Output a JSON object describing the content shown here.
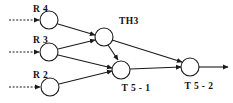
{
  "diagram": {
    "type": "petri-net-graph",
    "canvas": {
      "width": 233,
      "height": 103,
      "background": "#ffffff"
    },
    "stroke_color": "#1a1a1a",
    "label_color": "#111111",
    "nodes": [
      {
        "id": "R4",
        "label": "R 4",
        "cx": 49,
        "cy": 20,
        "r": 9,
        "label_x": 33,
        "label_y": 12
      },
      {
        "id": "R3",
        "label": "R 3",
        "cx": 49,
        "cy": 52,
        "r": 9,
        "label_x": 33,
        "label_y": 43
      },
      {
        "id": "R2",
        "label": "R 2",
        "cx": 50,
        "cy": 87,
        "r": 9,
        "label_x": 33,
        "label_y": 78
      },
      {
        "id": "TH3",
        "label": "TH3",
        "cx": 104,
        "cy": 37,
        "r": 9,
        "label_x": 119,
        "label_y": 24
      },
      {
        "id": "T5-1",
        "label": "T 5 - 1",
        "cx": 121,
        "cy": 70,
        "r": 9,
        "label_x": 136,
        "label_y": 91
      },
      {
        "id": "T5-2",
        "label": "T 5 - 2",
        "cx": 190,
        "cy": 67,
        "r": 9,
        "label_x": 199,
        "label_y": 89
      }
    ],
    "input_arrows": [
      {
        "id": "in-r4",
        "from_x": 9,
        "to_x": 39,
        "y": 20,
        "style": "dashed"
      },
      {
        "id": "in-r3",
        "from_x": 9,
        "to_x": 39,
        "y": 52,
        "style": "dashed"
      },
      {
        "id": "in-r2",
        "from_x": 9,
        "to_x": 40,
        "y": 87,
        "style": "dashed"
      }
    ],
    "edges": [
      {
        "id": "r4-th3",
        "from": "R4",
        "to": "TH3",
        "x1": 58,
        "y1": 24,
        "x2": 95,
        "y2": 35
      },
      {
        "id": "r3-th3",
        "from": "R3",
        "to": "TH3",
        "x1": 58,
        "y1": 49,
        "x2": 95,
        "y2": 40
      },
      {
        "id": "r3-t51",
        "from": "R3",
        "to": "T5-1",
        "x1": 58,
        "y1": 55,
        "x2": 112,
        "y2": 68
      },
      {
        "id": "r2-t51",
        "from": "R2",
        "to": "T5-1",
        "x1": 59,
        "y1": 84,
        "x2": 112,
        "y2": 71
      },
      {
        "id": "th3-t51",
        "from": "TH3",
        "to": "T5-1",
        "x1": 109,
        "y1": 45,
        "x2": 118,
        "y2": 60
      },
      {
        "id": "th3-t52",
        "from": "TH3",
        "to": "T5-2",
        "x1": 112,
        "y1": 40,
        "x2": 182,
        "y2": 63
      },
      {
        "id": "t51-t52",
        "from": "T5-1",
        "to": "T5-2",
        "x1": 130,
        "y1": 69,
        "x2": 181,
        "y2": 67
      }
    ],
    "output_arrow": {
      "id": "out-t52",
      "from_x": 199,
      "to_x": 228,
      "y": 67,
      "style": "solid"
    }
  }
}
